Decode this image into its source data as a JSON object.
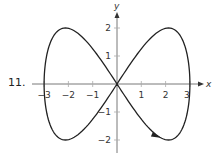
{
  "problem_number": "11.",
  "chart_data": {
    "type": "line",
    "title": "",
    "xlabel": "x",
    "ylabel": "y",
    "xlim": [
      -3.3,
      3.5
    ],
    "ylim": [
      -2.5,
      2.5
    ],
    "x_ticks": [
      -3,
      -2,
      -1,
      1,
      2,
      3
    ],
    "y_ticks": [
      -2,
      -1,
      1,
      2
    ],
    "x_tick_labels": [
      "−3",
      "−2",
      "−1",
      "1",
      "2",
      "3"
    ],
    "y_tick_labels": [
      "−2",
      "−1",
      "1",
      "2"
    ],
    "grid": false,
    "legend": null,
    "series": [
      {
        "name": "parametric curve",
        "parametric": "x = 3cos(t), y = 2sin(2t)",
        "direction_arrow_at": [
          1.6,
          -1.85
        ],
        "x": [
          3,
          2.12,
          0,
          -2.12,
          -3,
          -2.12,
          0,
          2.12,
          3
        ],
        "y": [
          0,
          2,
          0,
          -2,
          0,
          2,
          0,
          -2,
          0
        ]
      }
    ]
  }
}
